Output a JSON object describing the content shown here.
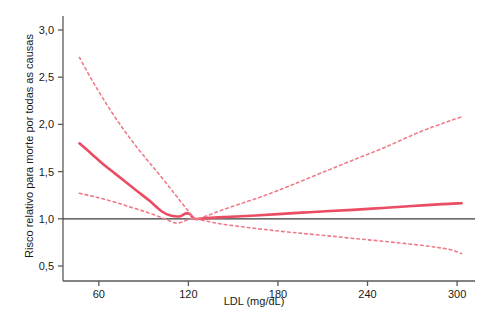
{
  "chart_data": {
    "type": "line",
    "title": "",
    "subtitle": "",
    "xlabel": "LDL (mg/dL)",
    "ylabel": "Risco relativo para morte por todas as causas",
    "xlim": [
      36,
      312
    ],
    "ylim": [
      0.42,
      3.12
    ],
    "xticks": [
      60,
      120,
      180,
      240,
      300
    ],
    "xticklabels": [
      "60",
      "120",
      "180",
      "240",
      "300"
    ],
    "yticks": [
      0.5,
      1.0,
      1.5,
      2.0,
      2.5,
      3.0
    ],
    "yticklabels": [
      "0,5",
      "1,0",
      "1,5",
      "2,0",
      "2,5",
      "3,0"
    ],
    "grid": false,
    "legend": null,
    "reference_line": {
      "name": "unity-reference-line",
      "orientation": "horizontal",
      "value": 1.0,
      "color": "#3d3d3d",
      "style": "solid"
    },
    "series": [
      {
        "name": "Risco relativo (estimativa)",
        "style": "solid",
        "color": "#ea4d63",
        "x": [
          47,
          55,
          62,
          70,
          78,
          86,
          94,
          102,
          108,
          114,
          118,
          121,
          124,
          130,
          140,
          152,
          165,
          180,
          196,
          212,
          230,
          250,
          270,
          290,
          303
        ],
        "y": [
          1.8,
          1.69,
          1.59,
          1.49,
          1.39,
          1.29,
          1.19,
          1.08,
          1.035,
          1.025,
          1.055,
          1.05,
          1.0,
          1.005,
          1.015,
          1.025,
          1.035,
          1.05,
          1.065,
          1.08,
          1.095,
          1.115,
          1.135,
          1.155,
          1.165
        ]
      },
      {
        "name": "Limite superior do IC",
        "style": "dashed",
        "color": "#ef7b88",
        "x": [
          47,
          55,
          63,
          72,
          82,
          92,
          100,
          108,
          114,
          118,
          121,
          124,
          132,
          142,
          155,
          170,
          188,
          208,
          230,
          252,
          275,
          292,
          303
        ],
        "y": [
          2.71,
          2.48,
          2.27,
          2.05,
          1.83,
          1.63,
          1.48,
          1.32,
          1.2,
          1.12,
          1.06,
          1.0,
          1.03,
          1.09,
          1.16,
          1.24,
          1.35,
          1.48,
          1.62,
          1.76,
          1.92,
          2.02,
          2.08
        ]
      },
      {
        "name": "Limite inferior do IC",
        "style": "dashed",
        "color": "#ef7b88",
        "x": [
          47,
          58,
          70,
          82,
          94,
          104,
          112,
          117,
          121,
          124,
          132,
          142,
          156,
          172,
          190,
          210,
          232,
          255,
          278,
          295,
          303
        ],
        "y": [
          1.27,
          1.23,
          1.18,
          1.12,
          1.06,
          1.0,
          0.955,
          0.975,
          1.0,
          1.0,
          0.975,
          0.945,
          0.915,
          0.885,
          0.855,
          0.825,
          0.79,
          0.755,
          0.715,
          0.675,
          0.63
        ]
      }
    ],
    "annotations": [],
    "colors": {
      "estimate": "#ea4d63",
      "confidence_band": "#ef7b88",
      "axis": "#5a5a5a",
      "reference": "#3d3d3d",
      "background": "#ffffff"
    }
  }
}
